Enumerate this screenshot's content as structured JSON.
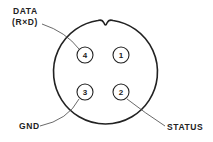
{
  "diagram": {
    "type": "connector-pinout",
    "pins": [
      {
        "number": "1",
        "label": ""
      },
      {
        "number": "2",
        "label": "STATUS"
      },
      {
        "number": "3",
        "label": "GND"
      },
      {
        "number": "4",
        "label": "DATA (R×D)"
      }
    ],
    "labels": {
      "data_line1": "DATA",
      "data_line2": "(R×D)",
      "gnd": "GND",
      "status": "STATUS"
    },
    "pin_numbers": {
      "p1": "1",
      "p2": "2",
      "p3": "3",
      "p4": "4"
    },
    "colors": {
      "stroke": "#222222",
      "background": "#ffffff"
    }
  }
}
